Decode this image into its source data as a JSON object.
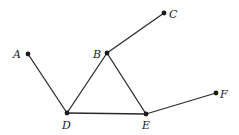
{
  "diagram": {
    "type": "undirected-graph",
    "nodes": [
      {
        "id": "A",
        "label": "A",
        "x": 28,
        "y": 54,
        "label_x": 13,
        "label_y": 58,
        "label_anchor": "start"
      },
      {
        "id": "B",
        "label": "B",
        "x": 107,
        "y": 53,
        "label_x": 93,
        "label_y": 58,
        "label_anchor": "start"
      },
      {
        "id": "C",
        "label": "C",
        "x": 164,
        "y": 13,
        "label_x": 169,
        "label_y": 18,
        "label_anchor": "start"
      },
      {
        "id": "D",
        "label": "D",
        "x": 67,
        "y": 113,
        "label_x": 62,
        "label_y": 129,
        "label_anchor": "start"
      },
      {
        "id": "E",
        "label": "E",
        "x": 146,
        "y": 114,
        "label_x": 142,
        "label_y": 129,
        "label_anchor": "start"
      },
      {
        "id": "F",
        "label": "F",
        "x": 216,
        "y": 93,
        "label_x": 220,
        "label_y": 98,
        "label_anchor": "start"
      }
    ],
    "edges": [
      {
        "from": "A",
        "to": "D"
      },
      {
        "from": "D",
        "to": "B"
      },
      {
        "from": "B",
        "to": "C"
      },
      {
        "from": "B",
        "to": "E"
      },
      {
        "from": "D",
        "to": "E"
      },
      {
        "from": "E",
        "to": "F"
      }
    ],
    "colors": {
      "edge": "#2a2a2a",
      "node": "#1a1a1a",
      "background": "#ffffff"
    }
  }
}
